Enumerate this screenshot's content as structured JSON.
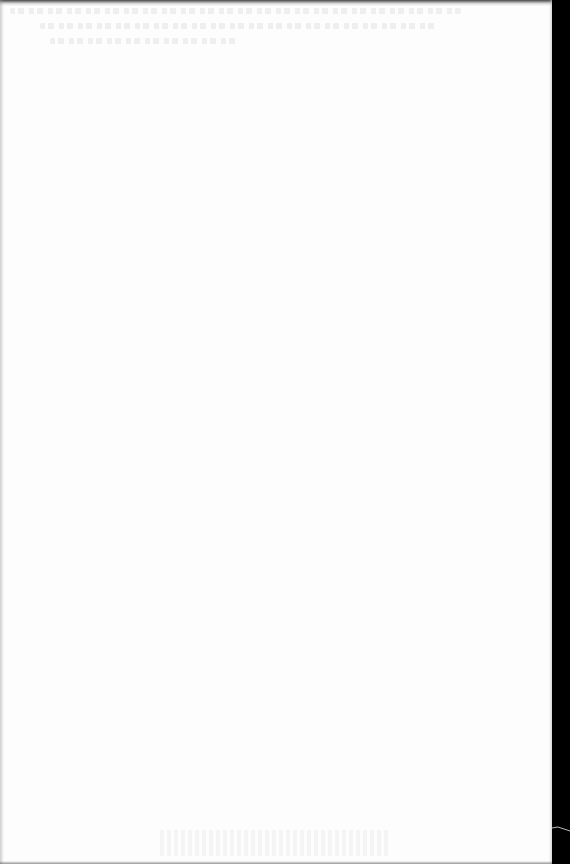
{
  "document": {
    "type": "scanned-page",
    "content": "",
    "colors": {
      "paper": "#fdfdfd",
      "background": "#000000",
      "edge_shadow": "#282828"
    }
  }
}
